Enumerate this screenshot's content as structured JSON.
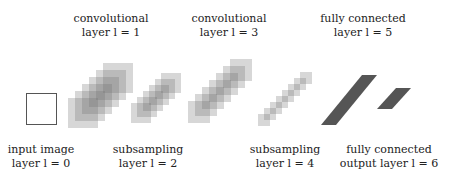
{
  "labels_top": [
    {
      "line1": "convolutional",
      "line2": "layer l = 1",
      "x": 111,
      "y": 12
    },
    {
      "line1": "convolutional",
      "line2": "layer l = 3",
      "x": 229,
      "y": 12
    },
    {
      "line1": "fully connected",
      "line2": "layer l = 5",
      "x": 363,
      "y": 12
    }
  ],
  "labels_bottom": [
    {
      "line1": "input image",
      "line2": "layer l = 0",
      "x": 41,
      "y": 143
    },
    {
      "line1": "subsampling",
      "line2": "layer l = 2",
      "x": 148,
      "y": 143
    },
    {
      "line1": "subsampling",
      "line2": "layer l = 4",
      "x": 285,
      "y": 143
    },
    {
      "line1": "fully connected",
      "line2": "output layer l = 6",
      "x": 389,
      "y": 143
    }
  ],
  "diagram": {
    "input": {
      "x": 26,
      "y": 93,
      "w": 29,
      "h": 30
    },
    "layer1": {
      "start_x": 68,
      "start_y": 98,
      "step_x": 7,
      "step_y": -7,
      "size": 30,
      "count": 6
    },
    "layer2": {
      "start_x": 131,
      "start_y": 103,
      "step_x": 6,
      "step_y": -6,
      "size": 20,
      "count": 6
    },
    "layer3": {
      "start_x": 188,
      "start_y": 101,
      "step_x": 7,
      "step_y": -7,
      "size": 22,
      "count": 7
    },
    "layer4": {
      "start_x": 258,
      "start_y": 114,
      "step_x": 6,
      "step_y": -6,
      "size": 12,
      "count": 8
    },
    "layer5": {
      "points": "321,125 336,125 377,75 362,75",
      "color": "#555555"
    },
    "layer6": {
      "points": "377,109 392,109 411,88 396,88",
      "color": "#555555"
    }
  }
}
